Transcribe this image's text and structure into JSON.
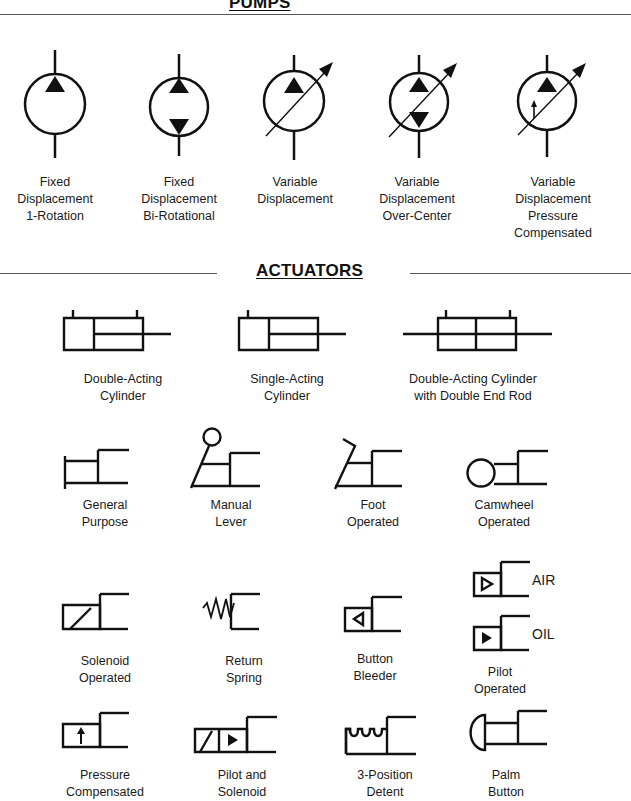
{
  "sections": {
    "pumps": {
      "title": "PUMPS"
    },
    "actuators": {
      "title": "ACTUATORS"
    }
  },
  "pumps": [
    {
      "label": "Fixed\nDisplacement\n1-Rotation",
      "icon": "fixed-displacement-pump-icon"
    },
    {
      "label": "Fixed\nDisplacement\nBi-Rotational",
      "icon": "bidirectional-pump-icon"
    },
    {
      "label": "Variable\nDisplacement",
      "icon": "variable-displacement-pump-icon"
    },
    {
      "label": "Variable\nDisplacement\nOver-Center",
      "icon": "over-center-pump-icon"
    },
    {
      "label": "Variable\nDisplacement\nPressure\nCompensated",
      "icon": "pressure-compensated-pump-icon"
    }
  ],
  "cylinders": [
    {
      "label": "Double-Acting\nCylinder",
      "icon": "double-acting-cylinder-icon"
    },
    {
      "label": "Single-Acting\nCylinder",
      "icon": "single-acting-cylinder-icon"
    },
    {
      "label": "Double-Acting Cylinder\nwith Double End Rod",
      "icon": "double-end-rod-cylinder-icon"
    }
  ],
  "operators_row1": [
    {
      "label": "General\nPurpose",
      "icon": "general-purpose-icon"
    },
    {
      "label": "Manual\nLever",
      "icon": "manual-lever-icon"
    },
    {
      "label": "Foot\nOperated",
      "icon": "foot-operated-icon"
    },
    {
      "label": "Camwheel\nOperated",
      "icon": "camwheel-icon"
    }
  ],
  "operators_row2": [
    {
      "label": "Solenoid\nOperated",
      "icon": "solenoid-icon"
    },
    {
      "label": "Return\nSpring",
      "icon": "return-spring-icon"
    },
    {
      "label": "Button\nBleeder",
      "icon": "button-bleeder-icon"
    },
    {
      "label": "Pilot\nOperated",
      "icon": "pilot-operated-icon",
      "variants": [
        "AIR",
        "OIL"
      ]
    }
  ],
  "operators_row3": [
    {
      "label": "Pressure\nCompensated",
      "icon": "pressure-compensated-icon"
    },
    {
      "label": "Pilot and\nSolenoid",
      "icon": "pilot-solenoid-icon"
    },
    {
      "label": "3-Position\nDetent",
      "icon": "detent-icon"
    },
    {
      "label": "Palm\nButton",
      "icon": "palm-button-icon"
    }
  ],
  "colors": {
    "ink": "#111111",
    "rule": "#555555",
    "background": "#ffffff"
  }
}
